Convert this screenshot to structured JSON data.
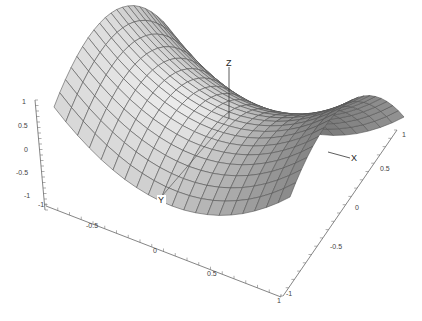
{
  "chart_data": {
    "type": "surface3d",
    "title": "",
    "function": "z = x^2 - y^2 (saddle)",
    "grid_resolution": 20,
    "x_range": [
      -1,
      1
    ],
    "y_range": [
      -1,
      1
    ],
    "z_range": [
      -1,
      1
    ],
    "axes": {
      "x": {
        "label": "X",
        "ticks": [
          "-1",
          "-0.5",
          "0",
          "0.5",
          "1"
        ]
      },
      "y": {
        "label": "Y",
        "ticks": [
          "-1",
          "-0.5",
          "0",
          "0.5",
          "1"
        ]
      },
      "z": {
        "label": "Z",
        "ticks": [
          "-1",
          "-0.5",
          "0",
          "0.5",
          "1"
        ]
      }
    },
    "grid": false,
    "colormap": "grayscale shaded",
    "mesh_color": "#555555",
    "legend": null
  },
  "labels": {
    "axis_x": "X",
    "axis_y": "Y",
    "axis_z": "Z"
  }
}
